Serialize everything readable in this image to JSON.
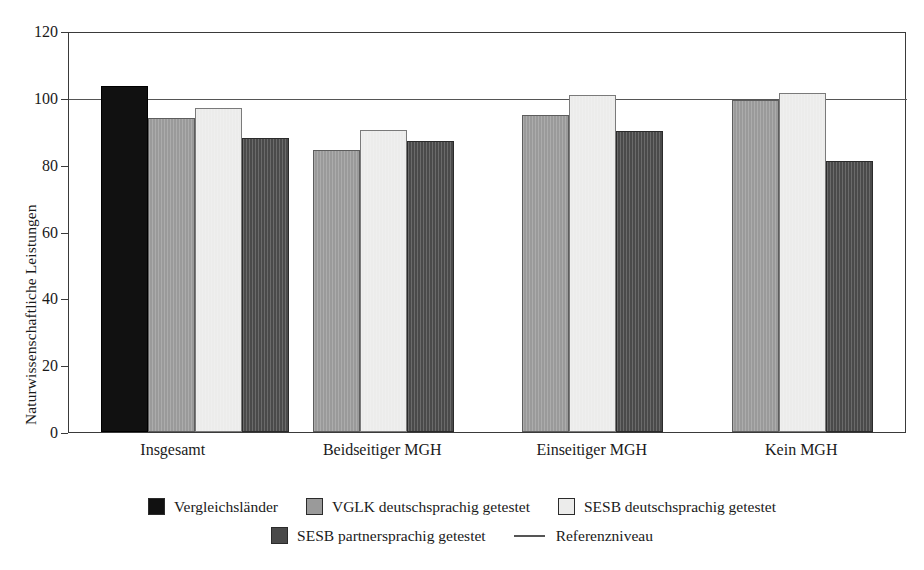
{
  "chart_data": {
    "type": "bar",
    "title": "",
    "xlabel": "",
    "ylabel": "Naturwissenschaftliche Leistungen",
    "ylim": [
      0,
      120
    ],
    "yticks": [
      0,
      20,
      40,
      60,
      80,
      100,
      120
    ],
    "ytick_labels": [
      "0",
      "20",
      "40",
      "60",
      "80",
      "100",
      "120"
    ],
    "grid": false,
    "legend_position": "bottom",
    "categories": [
      "Insgesamt",
      "Beidseitiger MGH",
      "Einseitiger MGH",
      "Kein MGH"
    ],
    "series": [
      {
        "name": "Vergleichsländer",
        "color": "#111111",
        "values": [
          103.5,
          null,
          null,
          null
        ]
      },
      {
        "name": "VGLK deutschsprachig getestet",
        "color": "#9a9a9a",
        "values": [
          94,
          84.5,
          95,
          99.5
        ]
      },
      {
        "name": "SESB deutschsprachig getestet",
        "color": "#ececeb",
        "values": [
          97,
          90.5,
          101,
          101.5
        ]
      },
      {
        "name": "SESB partnersprachig getestet",
        "color": "#4a4a4a",
        "values": [
          88,
          87,
          90,
          81
        ]
      }
    ],
    "annotations": [
      {
        "name": "Referenzniveau",
        "type": "hline",
        "value": 100,
        "color": "#555555"
      }
    ]
  },
  "legend": {
    "items": [
      {
        "label": "Vergleichsländer",
        "swatch": "legend-swatch-black",
        "kind": "swatch"
      },
      {
        "label": "VGLK deutschsprachig getestet",
        "swatch": "legend-swatch-gray",
        "kind": "swatch"
      },
      {
        "label": "SESB deutschsprachig getestet",
        "swatch": "legend-swatch-light",
        "kind": "swatch"
      },
      {
        "label": "SESB partnersprachig getestet",
        "swatch": "legend-swatch-dark",
        "kind": "swatch"
      },
      {
        "label": "Referenzniveau",
        "swatch": "legend-line-reference",
        "kind": "line"
      }
    ]
  },
  "top_crop_remnant": ". ,"
}
